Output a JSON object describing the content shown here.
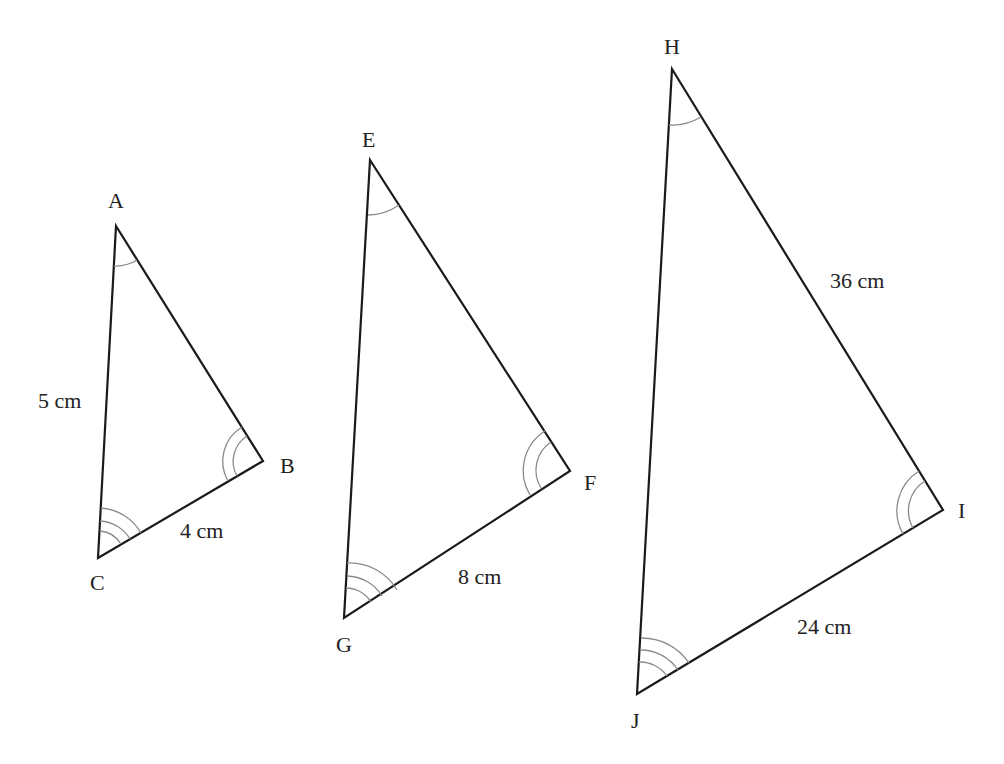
{
  "diagram": {
    "type": "similar-triangles",
    "colors": {
      "edge": "#1a1a1a",
      "arc": "#8a8a8a",
      "text": "#222222"
    },
    "triangles": [
      {
        "name": "ABC",
        "vertices": {
          "A": {
            "label": "A",
            "x": 116,
            "y": 226
          },
          "B": {
            "label": "B",
            "x": 263,
            "y": 461
          },
          "C": {
            "label": "C",
            "x": 98,
            "y": 558
          }
        },
        "side_labels": [
          {
            "side": "AC",
            "text": "5 cm"
          },
          {
            "side": "CB",
            "text": "4 cm"
          }
        ],
        "angle_marks": {
          "A": 1,
          "B": 2,
          "C": 3
        }
      },
      {
        "name": "EFG",
        "vertices": {
          "E": {
            "label": "E",
            "x": 370,
            "y": 160
          },
          "F": {
            "label": "F",
            "x": 570,
            "y": 471
          },
          "G": {
            "label": "G",
            "x": 344,
            "y": 618
          }
        },
        "side_labels": [
          {
            "side": "GF",
            "text": "8 cm"
          }
        ],
        "angle_marks": {
          "E": 1,
          "F": 2,
          "G": 3
        }
      },
      {
        "name": "HIJ",
        "vertices": {
          "H": {
            "label": "H",
            "x": 672,
            "y": 69
          },
          "I": {
            "label": "I",
            "x": 943,
            "y": 510
          },
          "J": {
            "label": "J",
            "x": 637,
            "y": 696
          }
        },
        "side_labels": [
          {
            "side": "HI",
            "text": "36 cm"
          },
          {
            "side": "JI",
            "text": "24 cm"
          }
        ],
        "angle_marks": {
          "H": 1,
          "I": 2,
          "J": 3
        }
      }
    ]
  }
}
